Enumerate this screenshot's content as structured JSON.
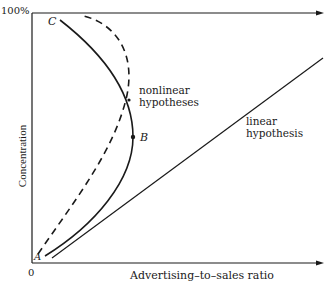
{
  "diagram": {
    "y_axis": {
      "label": "Concentration",
      "top_tick": "100%"
    },
    "x_axis": {
      "label": "Advertising–to–sales ratio",
      "origin": "0"
    },
    "points": {
      "A": "A",
      "B": "B",
      "C": "C"
    },
    "annotations": {
      "nonlinear_line1": "nonlinear",
      "nonlinear_line2": "hypotheses",
      "linear_line1": "linear",
      "linear_line2": "hypothesis"
    },
    "curves": [
      {
        "name": "solid nonlinear hypothesis",
        "style": "solid",
        "from": "A",
        "through": "B",
        "to": "C"
      },
      {
        "name": "dashed nonlinear hypothesis",
        "style": "dashed"
      },
      {
        "name": "linear hypothesis",
        "style": "solid-straight"
      }
    ],
    "colors": {
      "ink": "#1a1a1a",
      "background": "#ffffff"
    }
  }
}
